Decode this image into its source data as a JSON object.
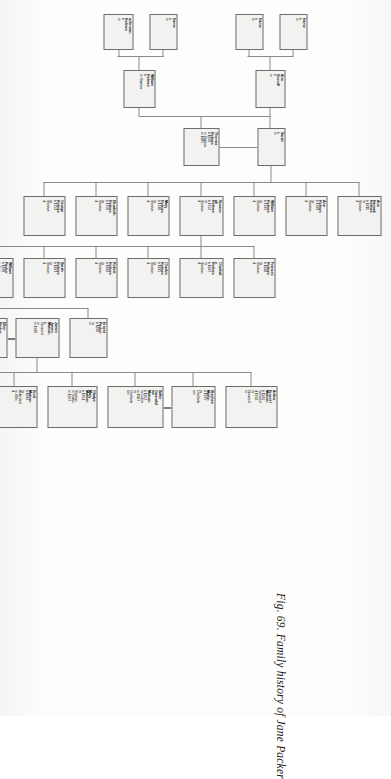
{
  "figure": {
    "caption": "Fig. 69. Family history of Jane Packer",
    "orientation_degrees": 90,
    "highlight_color": "#6e6e6e",
    "box_fill": "#f2f2f0",
    "line_color": "#8a8a8a"
  },
  "chart_data": {
    "type": "diagram",
    "title": "Fig. 69. Family history of Jane Packer",
    "diagram_kind": "genealogy-family-tree",
    "generations": 6
  },
  "nodes": [
    {
      "id": "n_name_a",
      "name": "Name",
      "lines": "b\nm",
      "x": 14,
      "y": 84,
      "w": 36,
      "h": 28,
      "highlight": false
    },
    {
      "id": "n_name_b",
      "name": "Name",
      "lines": "b\nm",
      "x": 14,
      "y": 128,
      "w": 36,
      "h": 28,
      "highlight": false
    },
    {
      "id": "n_name_c",
      "name": "Name",
      "lines": "b\nm",
      "x": 14,
      "y": 214,
      "w": 36,
      "h": 28,
      "highlight": false
    },
    {
      "id": "n_name_d",
      "name": "unknown\nHolmes",
      "lines": "b\nm",
      "x": 14,
      "y": 258,
      "w": 36,
      "h": 30,
      "highlight": false
    },
    {
      "id": "n_ann_sc",
      "name": "Ann\nScovell",
      "lines": "b\nm",
      "x": 70,
      "y": 106,
      "w": 38,
      "h": 30,
      "highlight": false
    },
    {
      "id": "n_wm_h1",
      "name": "William\nHolmes",
      "lines": "b\nm Stanton",
      "x": 70,
      "y": 236,
      "w": 38,
      "h": 32,
      "highlight": false
    },
    {
      "id": "n_sarah",
      "name": "Sarah",
      "lines": "b\nm",
      "x": 128,
      "y": 106,
      "w": 38,
      "h": 28,
      "highlight": false
    },
    {
      "id": "n_thomas1",
      "name": "Thomas\nHolmes",
      "lines": "b 1822\nm Stanton\nm 1885",
      "x": 128,
      "y": 172,
      "w": 38,
      "h": 36,
      "highlight": false
    },
    {
      "id": "n_annhan",
      "name": "Ann\nHannah\nHolmes",
      "lines": "b 1811\nin\nStanton\nd",
      "x": 196,
      "y": 10,
      "w": 40,
      "h": 44,
      "highlight": false
    },
    {
      "id": "n_ann_h",
      "name": "Ann\nHolmes",
      "lines": "b 1749\nin\nStanton\nd",
      "x": 196,
      "y": 64,
      "w": 40,
      "h": 42,
      "highlight": false
    },
    {
      "id": "n_wm_h2",
      "name": "William\nHolmes",
      "lines": "b 1746\nin\nStanton\nd",
      "x": 196,
      "y": 116,
      "w": 40,
      "h": 42,
      "highlight": false
    },
    {
      "id": "n_susan",
      "name": "Susann\nah\nHolmes",
      "lines": "b 1752\nin\nStanton\nd",
      "x": 196,
      "y": 168,
      "w": 40,
      "h": 44,
      "highlight": false
    },
    {
      "id": "n_mary1",
      "name": "Mary\nHolmes",
      "lines": "b 1748\nin\nStanton\nd",
      "x": 196,
      "y": 222,
      "w": 40,
      "h": 42,
      "highlight": false
    },
    {
      "id": "n_eliz",
      "name": "Elizabeth\nHolmes",
      "lines": "b 1750\nin\nStanton\nd",
      "x": 196,
      "y": 274,
      "w": 40,
      "h": 42,
      "highlight": false
    },
    {
      "id": "n_geo1",
      "name": "George\nHolmes",
      "lines": "b 1753\nin\nStanton\nd",
      "x": 196,
      "y": 326,
      "w": 40,
      "h": 42,
      "highlight": false
    },
    {
      "id": "n_frances",
      "name": "Frances\nHolmes",
      "lines": "b 1848\nin\nStanton\nd",
      "x": 258,
      "y": 116,
      "w": 40,
      "h": 42,
      "highlight": false
    },
    {
      "id": "n_charl",
      "name": "Charlott\ne\nHolmes",
      "lines": "b 1847\nin\nStanton\nd",
      "x": 258,
      "y": 168,
      "w": 40,
      "h": 44,
      "highlight": false
    },
    {
      "id": "n_chas",
      "name": "Charles\nHolmes",
      "lines": "b 1845\nin\nStanton\nd",
      "x": 258,
      "y": 222,
      "w": 40,
      "h": 42,
      "highlight": false
    },
    {
      "id": "n_robert",
      "name": "Robert\nHolmes",
      "lines": "b 1844\nin\nStanton\nd",
      "x": 258,
      "y": 274,
      "w": 40,
      "h": 42,
      "highlight": false
    },
    {
      "id": "n_sarah2",
      "name": "Sarah\nHolmes",
      "lines": "b 1843\nin\nStanton\nd",
      "x": 258,
      "y": 326,
      "w": 40,
      "h": 42,
      "highlight": false
    },
    {
      "id": "n_wmpack",
      "name": "William\nPacker",
      "lines": "b 1839\nin Cotn\nitt\nin Adwyn\nd",
      "x": 258,
      "y": 378,
      "w": 40,
      "h": 48,
      "highlight": false
    },
    {
      "id": "n_jane",
      "name": "Jane\nHolmes",
      "lines": "b 1842\nin\nStanton\nd 1923",
      "x": 258,
      "y": 440,
      "w": 40,
      "h": 46,
      "highlight": true
    },
    {
      "id": "n_mary2",
      "name": "Mary\nHolmes",
      "lines": "b 1831\nin\nStanton\nd",
      "x": 258,
      "y": 496,
      "w": 40,
      "h": 42,
      "highlight": false
    },
    {
      "id": "n_alfred",
      "name": "Alfred\nHolmes",
      "lines": "b 1836\nin\nStanton\nd",
      "x": 258,
      "y": 548,
      "w": 40,
      "h": 42,
      "highlight": false
    },
    {
      "id": "n_john",
      "name": "John\nHolmes",
      "lines": "b 1835\nin\nStanton\nd",
      "x": 258,
      "y": 600,
      "w": 40,
      "h": 42,
      "highlight": false
    },
    {
      "id": "n_thomas2",
      "name": "Thomas\nHolmes",
      "lines": "b 1829\nin\nStanton\nd",
      "x": 258,
      "y": 652,
      "w": 40,
      "h": 42,
      "highlight": false
    },
    {
      "id": "n_geo2",
      "name": "George\nHolmes",
      "lines": "b 1827\nin\nStanton\nd",
      "x": 258,
      "y": 704,
      "w": 40,
      "h": 42,
      "highlight": false
    },
    {
      "id": "n_ernest",
      "name": "Ernest\nPacker",
      "lines": "b 1895\nin\nm",
      "x": 318,
      "y": 284,
      "w": 40,
      "h": 38,
      "highlight": false
    },
    {
      "id": "n_jasmat",
      "name": "James\nJames\nMatson",
      "lines": "b\nGloucest\ner\nm 1930",
      "x": 318,
      "y": 332,
      "w": 40,
      "h": 44,
      "highlight": false
    },
    {
      "id": "n_ellen",
      "name": "Ellen\nPacker",
      "lines": "b 1893\nin\nm",
      "x": 318,
      "y": 384,
      "w": 40,
      "h": 38,
      "highlight": false
    },
    {
      "id": "n_skpack",
      "name": "Sarah\nEdith\nPacker",
      "lines": "b 1888\nin\nStanton\nd",
      "x": 318,
      "y": 440,
      "w": 40,
      "h": 44,
      "highlight": false
    },
    {
      "id": "n_maryap",
      "name": "Mary A.\nPacker",
      "lines": "b 1867\nin\nd",
      "x": 318,
      "y": 496,
      "w": 40,
      "h": 38,
      "highlight": false
    },
    {
      "id": "n_arthur",
      "name": "Arthur\nErnest /\nMatson",
      "lines": "b 1936\nin Bristol\nd 1932\nin\nGloucest\ner",
      "x": 386,
      "y": 114,
      "w": 42,
      "h": 52,
      "highlight": false
    },
    {
      "id": "n_steph",
      "name": "Stephen\nMartin",
      "lines": "b 1976\nin\nCheltenh\nam",
      "x": 386,
      "y": 176,
      "w": 42,
      "h": 44,
      "highlight": false
    },
    {
      "id": "n_sallie",
      "name": "Sallie\nGwendol\nine\nMatson",
      "lines": "b 1957\nin Colvin\nm 1987\nin\nCheltenh\nam",
      "x": 386,
      "y": 228,
      "w": 42,
      "h": 56,
      "highlight": false
    },
    {
      "id": "n_gmary",
      "name": "Gladys\nMary\nMatson",
      "lines": "b 1951\nin\nStanton\nm Tewks\nm 1967",
      "x": 386,
      "y": 294,
      "w": 42,
      "h": 50,
      "highlight": false
    },
    {
      "id": "n_enid",
      "name": "Enid\nMatson",
      "lines": "b 1844\nin\nAldershot\nm Wills\nd",
      "x": 386,
      "y": 354,
      "w": 42,
      "h": 46,
      "highlight": false
    },
    {
      "id": "n_wmfcole",
      "name": "William\nF. Cole",
      "lines": "b 1928\nin\nGloucest\ner\nm",
      "x": 386,
      "y": 410,
      "w": 42,
      "h": 46,
      "highlight": false
    },
    {
      "id": "n_elsie",
      "name": "Elsie\nMonica\nMatson",
      "lines": "b 1890\nin\nCheltenh\nam\nb 1930\nin\nGloucest\ner",
      "x": 386,
      "y": 468,
      "w": 42,
      "h": 66,
      "highlight": false
    }
  ]
}
